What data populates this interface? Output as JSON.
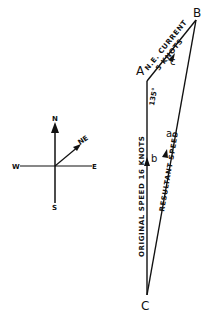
{
  "diagram": {
    "points": {
      "A": {
        "label": "A",
        "x": 147,
        "y": 81
      },
      "B": {
        "label": "B",
        "x": 196,
        "y": 20
      },
      "C": {
        "label": "C",
        "x": 147,
        "y": 295
      }
    },
    "vectors": {
      "a": {
        "label": "a",
        "name": "Resultant speed"
      },
      "b": {
        "label": "b",
        "name": "Original speed"
      },
      "c": {
        "label": "c",
        "name": "Current"
      }
    },
    "edge_labels": {
      "current_line1": "N.E. CURRENT",
      "current_line2": "5 KNOTS",
      "original": "ORIGINAL SPEED 16 KNOTS",
      "resultant": "RESULTANT SPEED"
    },
    "angle": "135°",
    "compass": {
      "north": "N",
      "south": "S",
      "east": "E",
      "west": "W",
      "northeast": "NE"
    },
    "colors": {
      "ink": "#111111",
      "background": "#ffffff"
    }
  }
}
